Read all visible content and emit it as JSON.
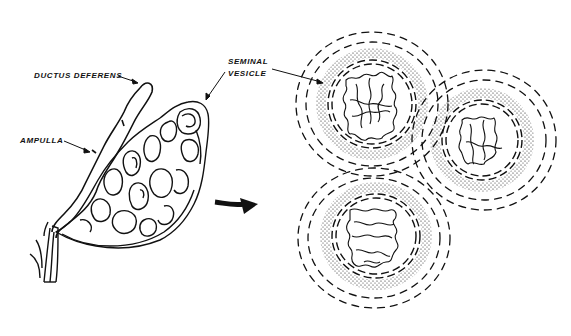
{
  "figure": {
    "ink_color": "#111111",
    "background": "#ffffff"
  },
  "labels": {
    "ductus_deferens": "DUCTUS DEFERENS",
    "ampulla": "AMPULLA",
    "seminal_vesicle_line1": "SEMINAL",
    "seminal_vesicle_line2": "VESICLE"
  },
  "cross_section": {
    "lobes": [
      {
        "name": "upper-left",
        "cx": 372,
        "cy": 102,
        "r": 44
      },
      {
        "name": "right",
        "cx": 482,
        "cy": 140,
        "r": 40
      },
      {
        "name": "lower",
        "cx": 376,
        "cy": 236,
        "r": 44
      }
    ]
  }
}
